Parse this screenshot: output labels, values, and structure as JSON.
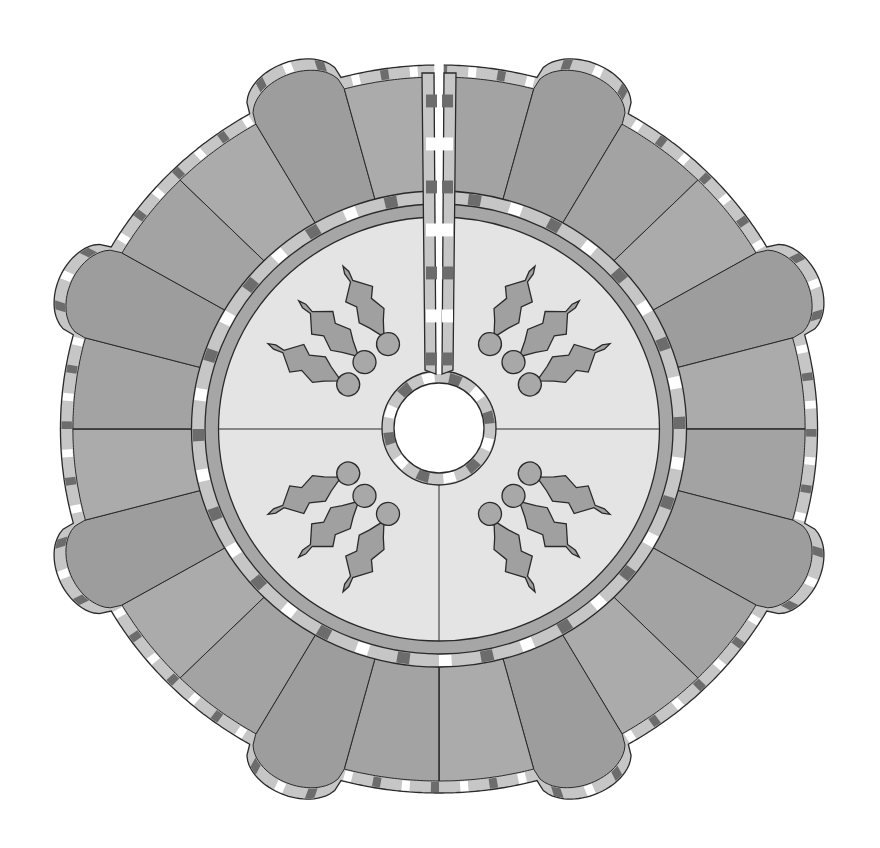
{
  "diagram": {
    "wedge_count": 24,
    "wedge_pattern": [
      "flat",
      "round",
      "flat"
    ],
    "has_back_slit": true,
    "slit_position": "top",
    "center_hole": true,
    "center_panel": {
      "sections": 4,
      "appliques_per_section": 3,
      "applique_motif": "holly leaf with berry"
    },
    "binding": "checkered gingham"
  },
  "colors": {
    "background": "#ffffff",
    "outline": "#2a2a2a",
    "round_wedge": "#9d9d9d",
    "flat_wedge_a": "#ababab",
    "flat_wedge_b": "#a3a3a3",
    "center_panel": "#e4e4e4",
    "inner_band": "#a6a6a6",
    "holly_leaf": "#a0a0a0",
    "holly_berry": "#a8a8a8",
    "binding_white": "#ffffff",
    "binding_light": "#c6c6c6",
    "binding_dark": "#6c6c6c"
  },
  "holly": [
    {
      "quadrant": "top-left",
      "angle_deg": 120,
      "type": "vertical"
    },
    {
      "quadrant": "top-left",
      "angle_deg": 137,
      "type": "diagonal"
    },
    {
      "quadrant": "top-left",
      "angle_deg": 153,
      "type": "horizontal"
    },
    {
      "quadrant": "top-right",
      "angle_deg": 60,
      "type": "vertical"
    },
    {
      "quadrant": "top-right",
      "angle_deg": 43,
      "type": "diagonal"
    },
    {
      "quadrant": "top-right",
      "angle_deg": 27,
      "type": "horizontal"
    },
    {
      "quadrant": "bottom-left",
      "angle_deg": 207,
      "type": "horizontal"
    },
    {
      "quadrant": "bottom-left",
      "angle_deg": 223,
      "type": "diagonal"
    },
    {
      "quadrant": "bottom-left",
      "angle_deg": 240,
      "type": "vertical"
    },
    {
      "quadrant": "bottom-right",
      "angle_deg": 333,
      "type": "horizontal"
    },
    {
      "quadrant": "bottom-right",
      "angle_deg": 317,
      "type": "diagonal"
    },
    {
      "quadrant": "bottom-right",
      "angle_deg": 300,
      "type": "vertical"
    }
  ]
}
